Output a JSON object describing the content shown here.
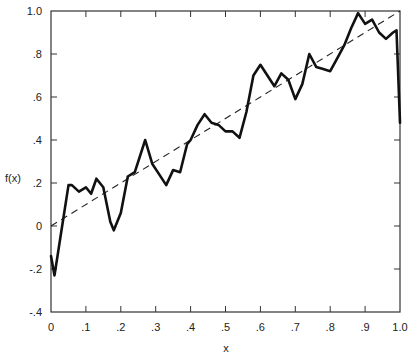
{
  "chart_data": {
    "type": "line",
    "title": "",
    "xlabel": "x",
    "ylabel": "f(x)",
    "xlim": [
      0,
      1.0
    ],
    "ylim": [
      -0.4,
      1.0
    ],
    "grid": false,
    "legend": null,
    "x_ticks": [
      {
        "value": 0,
        "label": "0"
      },
      {
        "value": 0.1,
        "label": ".1"
      },
      {
        "value": 0.2,
        "label": ".2"
      },
      {
        "value": 0.3,
        "label": ".3"
      },
      {
        "value": 0.4,
        "label": ".4"
      },
      {
        "value": 0.5,
        "label": ".5"
      },
      {
        "value": 0.6,
        "label": ".6"
      },
      {
        "value": 0.7,
        "label": ".7"
      },
      {
        "value": 0.8,
        "label": ".8"
      },
      {
        "value": 0.9,
        "label": ".9"
      },
      {
        "value": 1.0,
        "label": "1.0"
      }
    ],
    "y_ticks": [
      {
        "value": -0.4,
        "label": "-.4"
      },
      {
        "value": -0.2,
        "label": "-.2"
      },
      {
        "value": 0,
        "label": "0"
      },
      {
        "value": 0.2,
        "label": ".2"
      },
      {
        "value": 0.4,
        "label": ".4"
      },
      {
        "value": 0.6,
        "label": ".6"
      },
      {
        "value": 0.8,
        "label": ".8"
      },
      {
        "value": 1.0,
        "label": "1.0"
      }
    ],
    "series": [
      {
        "name": "f(x)",
        "style": "solid",
        "color": "#111111",
        "x": [
          0.0,
          0.01,
          0.03,
          0.05,
          0.06,
          0.08,
          0.1,
          0.115,
          0.13,
          0.15,
          0.17,
          0.18,
          0.2,
          0.22,
          0.24,
          0.27,
          0.29,
          0.31,
          0.33,
          0.35,
          0.37,
          0.39,
          0.4,
          0.42,
          0.44,
          0.46,
          0.48,
          0.5,
          0.52,
          0.54,
          0.56,
          0.58,
          0.6,
          0.62,
          0.64,
          0.66,
          0.68,
          0.7,
          0.72,
          0.74,
          0.76,
          0.78,
          0.8,
          0.82,
          0.84,
          0.86,
          0.88,
          0.9,
          0.92,
          0.94,
          0.96,
          0.98,
          0.99,
          1.0
        ],
        "values": [
          -0.14,
          -0.23,
          -0.02,
          0.19,
          0.19,
          0.16,
          0.18,
          0.15,
          0.22,
          0.18,
          0.02,
          -0.02,
          0.06,
          0.23,
          0.25,
          0.4,
          0.29,
          0.24,
          0.19,
          0.26,
          0.25,
          0.38,
          0.4,
          0.47,
          0.52,
          0.48,
          0.47,
          0.44,
          0.44,
          0.41,
          0.53,
          0.7,
          0.75,
          0.7,
          0.65,
          0.71,
          0.68,
          0.59,
          0.66,
          0.8,
          0.74,
          0.73,
          0.72,
          0.78,
          0.84,
          0.92,
          0.99,
          0.94,
          0.96,
          0.9,
          0.87,
          0.9,
          0.91,
          0.48
        ]
      },
      {
        "name": "y = x",
        "style": "dashed",
        "color": "#111111",
        "x": [
          0,
          1.0
        ],
        "values": [
          0,
          1.0
        ]
      }
    ]
  }
}
